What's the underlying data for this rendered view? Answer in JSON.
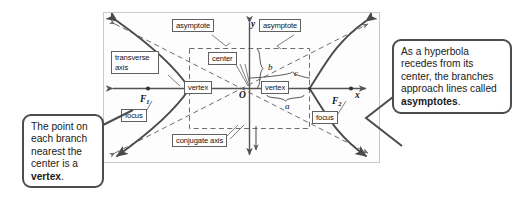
{
  "figure": {
    "type": "hyperbola-diagram"
  },
  "diagram": {
    "axis_labels": {
      "x": "x",
      "y": "y",
      "origin": "O"
    },
    "foci": [
      {
        "id": "F1",
        "letter": "F",
        "subscript": "1",
        "label": "focus"
      },
      {
        "id": "F2",
        "letter": "F",
        "subscript": "2",
        "label": "focus"
      }
    ],
    "segment_labels": {
      "a": "a",
      "b": "b",
      "c": "c"
    },
    "boxed_labels": {
      "asymptote_left": "asymptote",
      "asymptote_right": "asymptote",
      "transverse_axis": "transverse axis",
      "center": "center",
      "vertex_left": "vertex",
      "vertex_right": "vertex",
      "conjugate_axis": "conjugate axis"
    }
  },
  "callouts": {
    "left": {
      "text_plain": "The point on each branch nearest the center is a vertex.",
      "lead": "The point on each branch nearest the center is a ",
      "emphasis": "vertex",
      "trail": "."
    },
    "right": {
      "text_plain": "As a hyperbola recedes from its center, the branches approach lines called asymptotes.",
      "lead": "As a hyperbola recedes from its center, the branches approach lines called ",
      "emphasis": "asymptotes",
      "trail": "."
    }
  },
  "colors": {
    "background": "#ffffff",
    "frame_border": "#c9c9c9",
    "curve": "#4a4a4a",
    "dashed": "#6d6d6d",
    "axis": "#555555",
    "callout_border": "#4c4c4c",
    "text": "#1a1a1a"
  }
}
